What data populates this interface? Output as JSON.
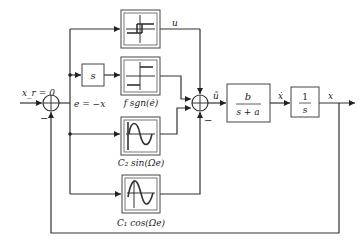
{
  "diagram": {
    "type": "control-block-diagram",
    "signals": {
      "reference": "x_r = 0",
      "error": "e = −x",
      "u_label": "u",
      "u_tilde": "ũ",
      "x_dot": "ẋ",
      "x_out": "x"
    },
    "sums": {
      "left": {
        "minus_sign": "−"
      },
      "right": {
        "minus_sign": "−"
      }
    },
    "blocks": {
      "derivative": {
        "label": "s"
      },
      "hysteresis": {
        "caption": ""
      },
      "sign": {
        "caption": "f sgn(ė)"
      },
      "sine": {
        "caption": "C₂ sin(Ωe)"
      },
      "cosine": {
        "caption": "C₁ cos(Ωe)"
      },
      "plant": {
        "numerator": "b",
        "denominator": "s + a"
      },
      "integrator": {
        "numerator": "1",
        "denominator": "s"
      }
    }
  }
}
